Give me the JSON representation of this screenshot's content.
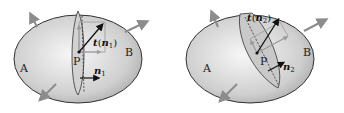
{
  "colors": {
    "body_fill_light": "#f2f2f2",
    "body_fill_dark": "#a9a9a9",
    "outline": "#333333",
    "arrow_gray": "#8c8c8c",
    "vector_dark": "#111111",
    "section_fill": "#c9c9c9"
  },
  "panels": [
    {
      "region_a": "A",
      "region_b": "B",
      "point": "P",
      "traction_symbol": "t",
      "traction_arg": "n",
      "traction_sub": "1",
      "normal_symbol": "n",
      "normal_sub": "1"
    },
    {
      "region_a": "A",
      "region_b": "B",
      "point": "P",
      "traction_symbol": "t",
      "traction_arg": "n",
      "traction_sub": "2",
      "normal_symbol": "n",
      "normal_sub": "2"
    }
  ]
}
